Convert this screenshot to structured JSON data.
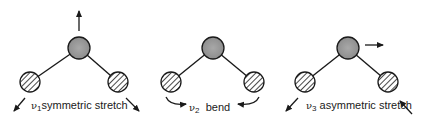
{
  "modes": [
    {
      "symbol": "ν",
      "index": "1",
      "name": "symmetric stretch",
      "motion": "central atom up, outer atoms outward-down"
    },
    {
      "symbol": "ν",
      "index": "2",
      "name": "bend",
      "motion": "outer atoms curve inward"
    },
    {
      "symbol": "ν",
      "index": "3",
      "name": "asymmetric stretch",
      "motion": "central atom right, left atom out, right atom in"
    }
  ],
  "legend": {
    "central_atom": "solid gray filled circle",
    "outer_atoms": "hatched circles"
  },
  "colors": {
    "central_atom_fill": "#9a9a9a",
    "outline": "#1a1a1a",
    "hatch": "#1a1a1a",
    "background": "#ffffff"
  }
}
